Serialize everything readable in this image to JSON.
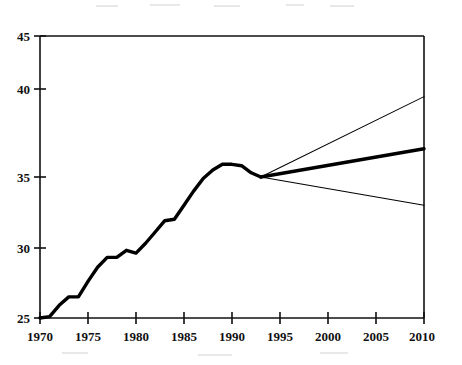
{
  "chart_data": {
    "type": "line",
    "title": "",
    "subtitle": "",
    "xlabel": "",
    "ylabel": "",
    "xlim": [
      1970,
      2010
    ],
    "ylim": [
      25,
      45
    ],
    "grid": false,
    "legend": "none",
    "x_ticks": [
      1970,
      1975,
      1980,
      1985,
      1990,
      1995,
      2000,
      2005,
      2010
    ],
    "x_tick_labels": [
      "1970",
      "1975",
      "1980",
      "1985",
      "1990",
      "1995",
      "2000",
      "2005",
      "2010"
    ],
    "y_ticks": [
      25,
      30,
      35,
      40,
      45
    ],
    "y_tick_labels": [
      "25",
      "30",
      "35",
      "40",
      "45"
    ],
    "series": [
      {
        "name": "historical",
        "style": "thick-solid",
        "color": "#000000",
        "x": [
          1970,
          1971,
          1972,
          1973,
          1974,
          1975,
          1976,
          1977,
          1978,
          1979,
          1980,
          1981,
          1982,
          1983,
          1984,
          1985,
          1986,
          1987,
          1988,
          1989,
          1990,
          1991,
          1992,
          1993
        ],
        "values": [
          25.0,
          25.1,
          25.9,
          26.5,
          26.5,
          27.6,
          28.6,
          29.3,
          29.3,
          29.8,
          29.6,
          30.3,
          31.1,
          31.9,
          32.0,
          33.0,
          34.0,
          34.9,
          35.5,
          35.9,
          35.9,
          35.8,
          35.3,
          35.0
        ]
      },
      {
        "name": "projection-high",
        "style": "thin-solid",
        "color": "#000000",
        "x": [
          1993,
          2010
        ],
        "values": [
          35.0,
          40.7
        ]
      },
      {
        "name": "projection-central",
        "style": "thick-solid",
        "color": "#000000",
        "x": [
          1993,
          2010
        ],
        "values": [
          35.0,
          37.0
        ]
      },
      {
        "name": "projection-low",
        "style": "thin-solid",
        "color": "#000000",
        "x": [
          1993,
          2010
        ],
        "values": [
          35.0,
          33.0
        ]
      }
    ],
    "annotations": [],
    "branch_point": {
      "x": 1993,
      "y": 35.0
    }
  }
}
